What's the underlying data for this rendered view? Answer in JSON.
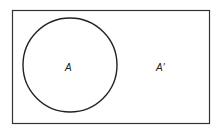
{
  "diagram": {
    "type": "venn",
    "universe": {
      "label": ""
    },
    "sets": [
      {
        "name": "A",
        "label": "A"
      }
    ],
    "complement": {
      "label": "A′"
    },
    "colors": {
      "stroke": "#222222",
      "background": "#ffffff"
    }
  }
}
